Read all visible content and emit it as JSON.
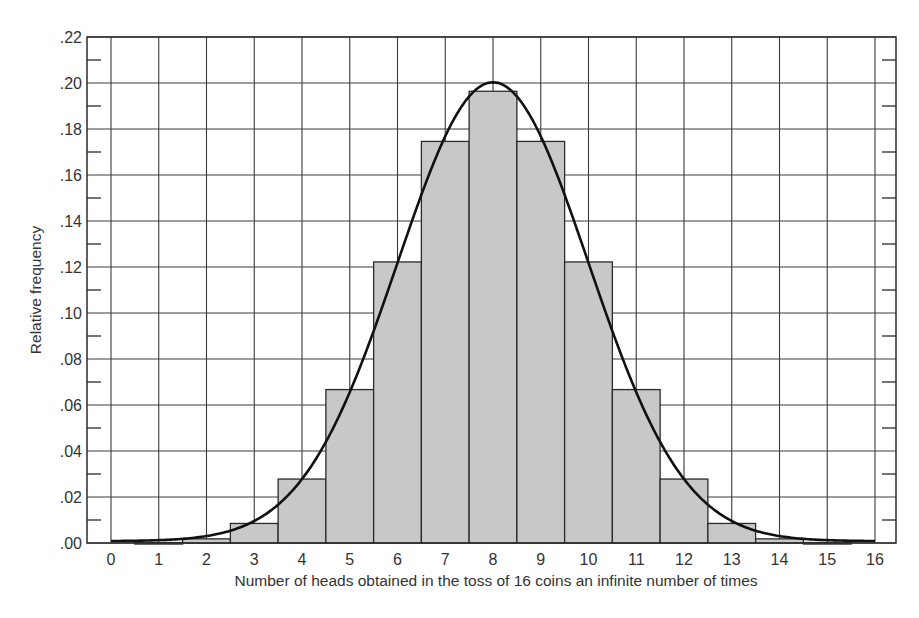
{
  "chart_data": {
    "type": "bar",
    "title": "",
    "xlabel": "Number of heads obtained in the toss of 16 coins an infinite number of times",
    "ylabel": "Relative frequency",
    "categories": [
      "0",
      "1",
      "2",
      "3",
      "4",
      "5",
      "6",
      "7",
      "8",
      "9",
      "10",
      "11",
      "12",
      "13",
      "14",
      "15",
      "16"
    ],
    "values": [
      0.0,
      0.0002,
      0.0018,
      0.0085,
      0.0278,
      0.0667,
      0.1222,
      0.1746,
      0.1964,
      0.1746,
      0.1222,
      0.0667,
      0.0278,
      0.0085,
      0.0018,
      0.0002,
      0.0
    ],
    "ylim": [
      0,
      0.22
    ],
    "xlim": [
      -0.5,
      16.5
    ],
    "yticks": [
      ".00",
      ".02",
      ".04",
      ".06",
      ".08",
      ".10",
      ".12",
      ".14",
      ".16",
      ".18",
      ".20",
      ".22"
    ],
    "ytick_values": [
      0,
      0.02,
      0.04,
      0.06,
      0.08,
      0.1,
      0.12,
      0.14,
      0.16,
      0.18,
      0.2,
      0.22
    ],
    "xticks": [
      "0",
      "1",
      "2",
      "3",
      "4",
      "5",
      "6",
      "7",
      "8",
      "9",
      "10",
      "11",
      "12",
      "13",
      "14",
      "15",
      "16"
    ],
    "grid": true,
    "legend": null,
    "overlay": {
      "type": "line",
      "name": "normal curve",
      "mean": 8,
      "sd": 2,
      "peak": 0.1995
    },
    "colors": {
      "bar_fill": "#c8c8c8",
      "bar_edge": "#2b2b2b",
      "grid": "#3a3a3a",
      "curve": "#111111",
      "frame": "#2b2b2b"
    }
  }
}
